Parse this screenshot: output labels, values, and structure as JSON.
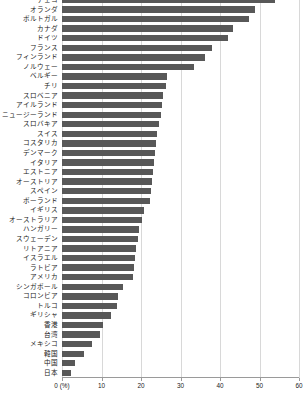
{
  "chart_data": {
    "type": "bar",
    "orientation": "horizontal",
    "title": "",
    "xlabel": "0 (%)",
    "ylabel": "",
    "xlim": [
      0,
      60
    ],
    "xticks": [
      0,
      10,
      20,
      30,
      40,
      50,
      60
    ],
    "xtick_labels": [
      "0 (%)",
      "10",
      "20",
      "30",
      "40",
      "50",
      "60"
    ],
    "grid": true,
    "legend": "none",
    "bar_color": "#585858",
    "categories": [
      "チェコ",
      "オランダ",
      "ポルトガル",
      "カナダ",
      "ドイツ",
      "フランス",
      "フィンランド",
      "ノルウェー",
      "ベルギー",
      "チリ",
      "スロベニア",
      "アイルランド",
      "ニュージーランド",
      "スロバキア",
      "スイス",
      "コスタリカ",
      "デンマーク",
      "イタリア",
      "エストニア",
      "オーストリア",
      "スペイン",
      "ポーランド",
      "イギリス",
      "オーストラリア",
      "ハンガリー",
      "スウェーデン",
      "リトアニア",
      "イスラエル",
      "ラトビア",
      "アメリカ",
      "シンガポール",
      "コロンビア",
      "トルコ",
      "ギリシャ",
      "香港",
      "台湾",
      "メキシコ",
      "韓国",
      "中国",
      "日本"
    ],
    "values": [
      54.0,
      48.8,
      47.3,
      43.3,
      42.0,
      38.0,
      36.3,
      33.5,
      26.5,
      26.3,
      25.5,
      25.3,
      25.0,
      24.5,
      24.0,
      23.8,
      23.5,
      23.3,
      23.0,
      22.8,
      22.5,
      22.3,
      20.8,
      20.3,
      19.5,
      19.3,
      18.8,
      18.5,
      18.3,
      18.0,
      15.5,
      14.3,
      13.8,
      12.5,
      10.5,
      9.5,
      7.5,
      5.5,
      3.3,
      2.3
    ]
  }
}
